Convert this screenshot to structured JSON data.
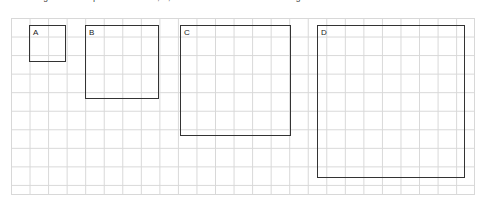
{
  "caption": {
    "text": "Figure: Four squares labelled A, B, C and D drawn on a centimetre grid."
  },
  "grid": {
    "cell_label": "grid-cell",
    "columns": 25,
    "rows": 9,
    "cell_size_px": 18.55,
    "line_color": "#d8d8d8",
    "background_color": "#ffffff"
  },
  "shapes": {
    "stroke_color": "#333333",
    "items": [
      {
        "label": "A",
        "name": "square-a",
        "left": 29,
        "top": 25,
        "size": 37,
        "cells_per_side": 2
      },
      {
        "label": "B",
        "name": "square-b",
        "left": 85,
        "top": 25,
        "size": 74,
        "cells_per_side": 4
      },
      {
        "label": "C",
        "name": "square-c",
        "left": 180,
        "top": 25,
        "size": 111,
        "cells_per_side": 6
      },
      {
        "label": "D",
        "name": "square-d",
        "left": 317,
        "top": 25,
        "size": 148,
        "cells_per_side": 8
      }
    ]
  }
}
